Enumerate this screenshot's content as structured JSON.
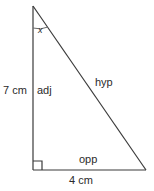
{
  "figure": {
    "type": "right-triangle-diagram",
    "background_color": "#ffffff",
    "stroke_color": "#3a3a3a",
    "text_color": "#2b2b2b",
    "vertices": {
      "apex": {
        "x": 33,
        "y": 6
      },
      "right_angle": {
        "x": 33,
        "y": 170
      },
      "base_right": {
        "x": 146,
        "y": 170
      }
    },
    "angle_marker": {
      "label": "x",
      "at_vertex": "apex",
      "radius": 22
    },
    "right_angle_marker": {
      "at_vertex": "right_angle",
      "size": 9
    },
    "sides": {
      "adjacent": {
        "name": "adj",
        "length": "7 cm"
      },
      "hypotenuse": {
        "name": "hyp",
        "length": ""
      },
      "opposite": {
        "name": "opp",
        "length": "4 cm"
      }
    }
  }
}
